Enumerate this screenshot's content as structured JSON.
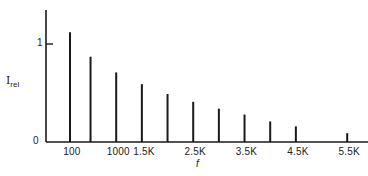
{
  "chart_data": {
    "type": "bar",
    "title": "",
    "xlabel": "f",
    "ylabel": "I_rel",
    "ylabel_main": "I",
    "ylabel_sub": "rel",
    "ylim": [
      0,
      1.35
    ],
    "y_ticks": [
      {
        "value": 0,
        "label": "0"
      },
      {
        "value": 1,
        "label": "1"
      }
    ],
    "x_tick_labels": [
      {
        "x": 100,
        "label": "100"
      },
      {
        "x": 1000,
        "label": "1000"
      },
      {
        "x": 1500,
        "label": "1.5K"
      },
      {
        "x": 2500,
        "label": "2.5K"
      },
      {
        "x": 3500,
        "label": "3.5K"
      },
      {
        "x": 4500,
        "label": "4.5K"
      },
      {
        "x": 5500,
        "label": "5.5K"
      },
      {
        "x": 6000,
        "label": "6K"
      }
    ],
    "x": [
      100,
      500,
      1000,
      1500,
      2000,
      2500,
      3000,
      3500,
      4000,
      4500,
      5500,
      6000
    ],
    "values": [
      1.12,
      0.87,
      0.71,
      0.59,
      0.49,
      0.41,
      0.34,
      0.28,
      0.21,
      0.16,
      0.09,
      0.08
    ],
    "grid": false,
    "legend": null
  },
  "colors": {
    "ink": "#1a1a1a",
    "background": "#ffffff"
  }
}
